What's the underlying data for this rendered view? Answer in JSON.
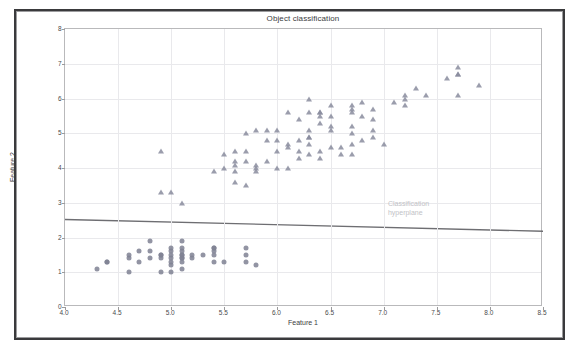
{
  "chart_data": {
    "type": "scatter",
    "title": "Object classification",
    "xlabel": "Feature 1",
    "ylabel": "Feature 2",
    "xlim": [
      4.0,
      8.5
    ],
    "ylim": [
      0,
      8
    ],
    "xticks": [
      "4.0",
      "4.5",
      "5.0",
      "5.5",
      "6.0",
      "6.5",
      "7.0",
      "7.5",
      "8.0",
      "8.5"
    ],
    "xtick_values": [
      4.0,
      4.5,
      5.0,
      5.5,
      6.0,
      6.5,
      7.0,
      7.5,
      8.0,
      8.5
    ],
    "yticks": [
      "0",
      "1",
      "2",
      "3",
      "4",
      "5",
      "6",
      "7",
      "8"
    ],
    "ytick_values": [
      0,
      1,
      2,
      3,
      4,
      5,
      6,
      7,
      8
    ],
    "grid": true,
    "legend": "none",
    "annotations": [
      {
        "name": "classification-hyperplane-label",
        "text": "Classification\nhyperplane",
        "x": 7.05,
        "y": 2.62,
        "color": "#c2c2c6"
      }
    ],
    "decision_boundary": {
      "name": "classification-hyperplane",
      "type": "line",
      "x_start": 4.0,
      "y_start": 2.52,
      "x_end": 8.5,
      "y_end": 2.18,
      "color": "#6e6e72",
      "width": 1.4
    },
    "series": [
      {
        "name": "Class A",
        "marker": "circle",
        "color": "#7f8193",
        "points": [
          [
            4.3,
            1.1
          ],
          [
            4.4,
            1.3
          ],
          [
            4.4,
            1.3
          ],
          [
            4.6,
            1.0
          ],
          [
            4.6,
            1.4
          ],
          [
            4.6,
            1.5
          ],
          [
            4.7,
            1.3
          ],
          [
            4.7,
            1.6
          ],
          [
            4.8,
            1.4
          ],
          [
            4.8,
            1.6
          ],
          [
            4.8,
            1.9
          ],
          [
            4.9,
            1.0
          ],
          [
            4.9,
            1.4
          ],
          [
            4.9,
            1.5
          ],
          [
            5.0,
            1.0
          ],
          [
            5.0,
            1.2
          ],
          [
            5.0,
            1.3
          ],
          [
            5.0,
            1.4
          ],
          [
            5.0,
            1.6
          ],
          [
            5.0,
            1.7
          ],
          [
            5.1,
            1.1
          ],
          [
            5.1,
            1.3
          ],
          [
            5.1,
            1.4
          ],
          [
            5.1,
            1.5
          ],
          [
            5.1,
            1.5
          ],
          [
            5.1,
            1.6
          ],
          [
            5.1,
            1.7
          ],
          [
            5.1,
            1.9
          ],
          [
            5.2,
            1.4
          ],
          [
            5.2,
            1.5
          ],
          [
            5.3,
            1.5
          ],
          [
            5.4,
            1.3
          ],
          [
            5.4,
            1.5
          ],
          [
            5.4,
            1.7
          ],
          [
            5.4,
            1.7
          ],
          [
            5.5,
            1.3
          ],
          [
            5.7,
            1.3
          ],
          [
            5.7,
            1.5
          ],
          [
            5.7,
            1.7
          ],
          [
            5.8,
            1.2
          ],
          [
            5.0,
            1.5
          ],
          [
            4.9,
            1.5
          ],
          [
            5.4,
            1.6
          ],
          [
            5.1,
            1.4
          ]
        ]
      },
      {
        "name": "Class B",
        "marker": "triangle",
        "color": "#8a8c9d",
        "points": [
          [
            4.9,
            4.5
          ],
          [
            4.9,
            3.3
          ],
          [
            5.0,
            3.3
          ],
          [
            5.1,
            3.0
          ],
          [
            5.4,
            3.9
          ],
          [
            5.5,
            4.0
          ],
          [
            5.5,
            4.4
          ],
          [
            5.6,
            4.2
          ],
          [
            5.6,
            4.1
          ],
          [
            5.6,
            3.9
          ],
          [
            5.6,
            3.6
          ],
          [
            5.6,
            4.5
          ],
          [
            5.7,
            4.2
          ],
          [
            5.7,
            4.5
          ],
          [
            5.7,
            3.5
          ],
          [
            5.7,
            5.0
          ],
          [
            5.8,
            4.0
          ],
          [
            5.8,
            4.1
          ],
          [
            5.8,
            5.1
          ],
          [
            5.8,
            3.9
          ],
          [
            5.9,
            4.2
          ],
          [
            5.9,
            4.8
          ],
          [
            5.9,
            5.1
          ],
          [
            6.0,
            4.0
          ],
          [
            6.0,
            4.5
          ],
          [
            6.0,
            5.1
          ],
          [
            6.0,
            4.8
          ],
          [
            6.1,
            4.0
          ],
          [
            6.1,
            4.7
          ],
          [
            6.1,
            4.6
          ],
          [
            6.1,
            5.6
          ],
          [
            6.2,
            4.3
          ],
          [
            6.2,
            4.5
          ],
          [
            6.2,
            4.8
          ],
          [
            6.2,
            5.4
          ],
          [
            6.3,
            4.4
          ],
          [
            6.3,
            4.7
          ],
          [
            6.3,
            4.9
          ],
          [
            6.3,
            5.6
          ],
          [
            6.3,
            5.1
          ],
          [
            6.3,
            6.0
          ],
          [
            6.3,
            4.9
          ],
          [
            6.4,
            4.3
          ],
          [
            6.4,
            4.5
          ],
          [
            6.4,
            5.3
          ],
          [
            6.4,
            5.5
          ],
          [
            6.4,
            5.6
          ],
          [
            6.4,
            5.6
          ],
          [
            6.5,
            4.6
          ],
          [
            6.5,
            5.1
          ],
          [
            6.5,
            5.2
          ],
          [
            6.5,
            5.5
          ],
          [
            6.5,
            5.8
          ],
          [
            6.6,
            4.4
          ],
          [
            6.6,
            4.6
          ],
          [
            6.7,
            4.4
          ],
          [
            6.7,
            4.7
          ],
          [
            6.7,
            5.0
          ],
          [
            6.7,
            5.2
          ],
          [
            6.7,
            5.6
          ],
          [
            6.7,
            5.7
          ],
          [
            6.7,
            5.8
          ],
          [
            6.8,
            4.8
          ],
          [
            6.8,
            5.5
          ],
          [
            6.8,
            5.9
          ],
          [
            6.9,
            4.9
          ],
          [
            6.9,
            5.1
          ],
          [
            6.9,
            5.4
          ],
          [
            6.9,
            5.7
          ],
          [
            7.0,
            4.7
          ],
          [
            7.1,
            5.9
          ],
          [
            7.2,
            5.8
          ],
          [
            7.2,
            6.0
          ],
          [
            7.2,
            6.1
          ],
          [
            7.3,
            6.3
          ],
          [
            7.4,
            6.1
          ],
          [
            7.6,
            6.6
          ],
          [
            7.7,
            6.1
          ],
          [
            7.7,
            6.7
          ],
          [
            7.7,
            6.9
          ],
          [
            7.7,
            6.7
          ],
          [
            7.9,
            6.4
          ]
        ]
      }
    ]
  }
}
